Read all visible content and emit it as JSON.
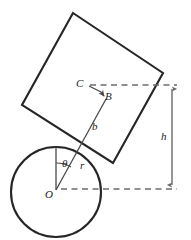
{
  "figure": {
    "kind": "geometry-diagram",
    "background_color": "#ffffff",
    "stroke_color": "#262626",
    "thin_stroke_color": "#4a4a4a",
    "dashed_stroke_color": "#6b6b6b",
    "labels": {
      "center": "O",
      "radius": "r",
      "angle": "θ",
      "offset": "b",
      "point_b": "B",
      "point_c": "C",
      "height": "h"
    },
    "geometry": {
      "circle": {
        "cx": 56,
        "cy": 192,
        "r": 45
      },
      "square_corners": [
        {
          "x": 73,
          "y": 13
        },
        {
          "x": 163,
          "y": 73
        },
        {
          "x": 113,
          "y": 163
        },
        {
          "x": 22,
          "y": 105
        }
      ],
      "vertical_from_center": {
        "x1": 56,
        "y1": 192,
        "x2": 56,
        "y2": 147
      },
      "radius_line": {
        "x1": 56,
        "y1": 192,
        "x2": 110,
        "y2": 98
      },
      "c_to_b_line": [
        {
          "x": 88,
          "y": 86
        },
        {
          "x": 101,
          "y": 92
        },
        {
          "x": 104,
          "y": 97
        }
      ],
      "dashed_top": {
        "x1": 90,
        "y1": 85,
        "x2": 178,
        "y2": 85
      },
      "dashed_bottom": {
        "x1": 60,
        "y1": 189,
        "x2": 178,
        "y2": 189
      },
      "height_arrow": {
        "x": 172,
        "y1": 85,
        "y2": 189
      },
      "angle_arc": {
        "cx": 56,
        "cy": 192,
        "radius": 33,
        "start_deg": -90,
        "end_deg": -60
      }
    },
    "label_positions": {
      "center": {
        "x": 46,
        "y": 190
      },
      "radius": {
        "x": 80,
        "y": 161
      },
      "angle": {
        "x": 62,
        "y": 159
      },
      "offset": {
        "x": 92,
        "y": 122
      },
      "point_b": {
        "x": 105,
        "y": 92
      },
      "point_c": {
        "x": 77,
        "y": 79
      },
      "height": {
        "x": 162,
        "y": 132
      }
    }
  }
}
